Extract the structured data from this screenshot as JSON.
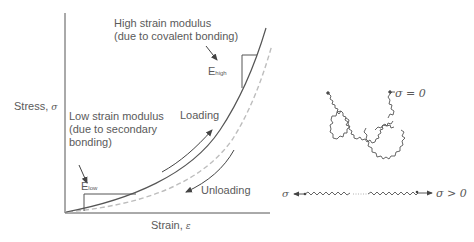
{
  "graph": {
    "y_axis_label": "Stress,",
    "y_axis_symbol": "σ",
    "x_axis_label": "Strain,",
    "x_axis_symbol": "ε",
    "high_modulus": {
      "line1": "High strain modulus",
      "line2": "(due to covalent bonding)",
      "symbol": "E",
      "subscript": "high"
    },
    "low_modulus": {
      "line1": "Low strain modulus",
      "line2": "(due to secondary",
      "line3": "bonding)",
      "symbol": "E",
      "subscript": "low"
    },
    "loading_label": "Loading",
    "unloading_label": "Unloading"
  },
  "chains": {
    "relaxed_label": "σ = 0",
    "stretched_left_symbol": "σ",
    "stretched_right_label": "σ > 0"
  },
  "colors": {
    "line": "#555555",
    "dashed": "#bdbdbd",
    "text": "#5a5a5a"
  }
}
